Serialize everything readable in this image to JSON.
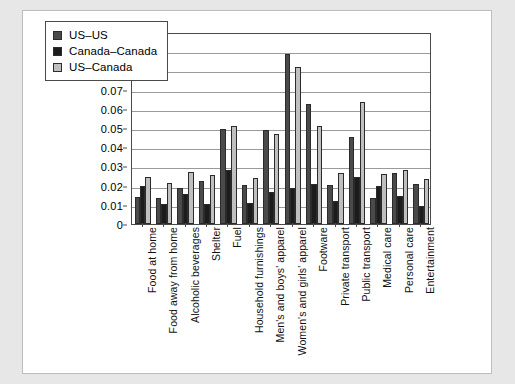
{
  "chart_data": {
    "type": "bar",
    "title": "",
    "subtitle": "",
    "xlabel": "",
    "ylabel": "",
    "ylim": [
      0,
      0.1
    ],
    "y_ticks": [
      "0",
      "0.01",
      "0.02",
      "0.03",
      "0.04",
      "0.05",
      "0.06",
      "0.07",
      "0.08",
      "0.09",
      "0.10"
    ],
    "y_tick_values": [
      0,
      0.01,
      0.02,
      0.03,
      0.04,
      0.05,
      0.06,
      0.07,
      0.08,
      0.09,
      0.1
    ],
    "grid": true,
    "legend_position": "top-left",
    "categories": [
      "Food at home",
      "Food away from home",
      "Alcoholic beverages",
      "Shelter",
      "Fuel",
      "Household furnishings",
      "Men's and boys' apparel",
      "Women's and girls' apparel",
      "Footware",
      "Private transport",
      "Public transport",
      "Medical care",
      "Personal care",
      "Entertainment"
    ],
    "series": [
      {
        "name": "US–US",
        "color": "#4a4a4a",
        "values": [
          0.014,
          0.0135,
          0.0188,
          0.0223,
          0.0495,
          0.0203,
          0.0492,
          0.0885,
          0.0627,
          0.0205,
          0.0455,
          0.0138,
          0.0268,
          0.0208
        ]
      },
      {
        "name": "Canada–Canada",
        "color": "#1c1c1c",
        "values": [
          0.02,
          0.0105,
          0.0155,
          0.0102,
          0.0281,
          0.0107,
          0.0167,
          0.019,
          0.0207,
          0.012,
          0.0247,
          0.0197,
          0.0147,
          0.0096
        ]
      },
      {
        "name": "US–Canada",
        "color": "#bfbfbf",
        "values": [
          0.0245,
          0.0215,
          0.0273,
          0.0255,
          0.0508,
          0.024,
          0.047,
          0.0818,
          0.0513,
          0.0265,
          0.0633,
          0.0263,
          0.0279,
          0.0237
        ]
      }
    ]
  },
  "legend": {
    "items": [
      {
        "label": "US–US",
        "color": "#4a4a4a"
      },
      {
        "label": "Canada–Canada",
        "color": "#1c1c1c"
      },
      {
        "label": "US–Canada",
        "color": "#bfbfbf"
      }
    ]
  }
}
